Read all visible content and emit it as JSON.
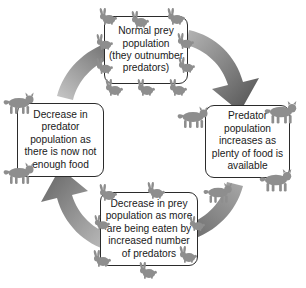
{
  "diagram": {
    "type": "cycle-diagram",
    "direction": "clockwise",
    "background_color": "#ffffff",
    "box_border_color": "#2b2b2b",
    "box_fill_color": "#ffffff",
    "arrow_color_light": "#b9b9b9",
    "arrow_color_dark": "#555555",
    "animal_color": "#8e8e8e",
    "nodes": [
      {
        "id": "normal-prey",
        "position": "top",
        "text": "Normal prey\npopulation\n(they outnumber\npredators)",
        "decoration": "rabbits"
      },
      {
        "id": "predator-increase",
        "position": "right",
        "text": "Predator\npopulation\nincreases as\nplenty of food is\navailable",
        "decoration": "lynxes"
      },
      {
        "id": "prey-decrease",
        "position": "bottom",
        "text": "Decrease in prey\npopulation as more\nare being eaten by\nincreased number\nof predators",
        "decoration": "rabbits"
      },
      {
        "id": "predator-decrease",
        "position": "left",
        "text": "Decrease in\npredator\npopulation as\nthere is now not\nenough food",
        "decoration": "lynxes"
      }
    ],
    "arrows": [
      {
        "id": "arrow-top-right",
        "from": "normal-prey",
        "to": "predator-increase",
        "direction": "down-right"
      },
      {
        "id": "arrow-bottom-right",
        "from": "predator-increase",
        "to": "prey-decrease",
        "direction": "down-left"
      },
      {
        "id": "arrow-bottom-left",
        "from": "prey-decrease",
        "to": "predator-decrease",
        "direction": "up-left"
      },
      {
        "id": "arrow-top-left",
        "from": "predator-decrease",
        "to": "normal-prey",
        "direction": "up-right"
      }
    ]
  }
}
